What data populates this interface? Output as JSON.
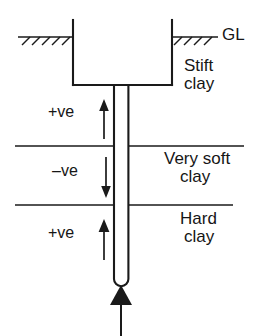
{
  "diagram": {
    "ground_level_label": "GL",
    "soil_layers": [
      {
        "name": "stiff-clay",
        "line1": "Stift",
        "line2": "clay"
      },
      {
        "name": "very-soft-clay",
        "line1": "Very soft",
        "line2": "clay"
      },
      {
        "name": "hard-clay",
        "line1": "Hard",
        "line2": "clay"
      }
    ],
    "friction_annotations": [
      {
        "name": "positive-friction-upper",
        "label": "+ve",
        "direction": "up"
      },
      {
        "name": "negative-friction-middle",
        "label": "–ve",
        "direction": "down"
      },
      {
        "name": "positive-friction-lower",
        "label": "+ve",
        "direction": "up"
      }
    ],
    "base_load": {
      "name": "base-resistance-arrow",
      "direction": "up"
    },
    "colors": {
      "line": "#1a1a1a",
      "text": "#161616",
      "background": "#ffffff"
    }
  }
}
